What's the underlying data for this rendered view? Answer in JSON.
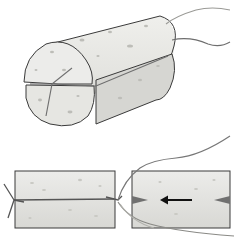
{
  "figure": {
    "colors": {
      "background": "#ffffff",
      "sponge_fill": "#e8e8e4",
      "sponge_shade": "#cfcfca",
      "outline": "#3a3a3a",
      "string": "#6e6e6e",
      "string_light": "#b5b5b0",
      "arrow": "#111111"
    },
    "panels": [
      {
        "id": "top",
        "label": "tied-sponge-cylinder-perspective"
      },
      {
        "id": "bottom-left",
        "label": "sponge-side-view-tied"
      },
      {
        "id": "bottom-right",
        "label": "sponge-side-view-threading"
      }
    ],
    "arrow": {
      "direction": "left"
    }
  }
}
